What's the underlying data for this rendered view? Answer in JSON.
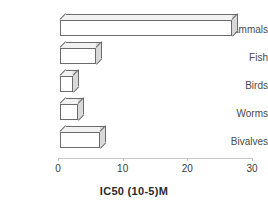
{
  "chart_data": {
    "type": "bar",
    "orientation": "horizontal",
    "style": "3d-bars",
    "title": "",
    "subtitle": "",
    "xlabel": "IC50 (10-5)M",
    "ylabel": "",
    "categories": [
      "Mammals",
      "Fish",
      "Birds",
      "Worms",
      "Bivalves"
    ],
    "values": [
      26.6,
      5.6,
      2.0,
      2.8,
      6.2
    ],
    "series": [
      {
        "name": "IC50",
        "values": [
          26.6,
          5.6,
          2.0,
          2.8,
          6.2
        ]
      }
    ],
    "xlim": [
      0,
      30
    ],
    "xticks": [
      0,
      10,
      20,
      30
    ],
    "xtick_labels": [
      "0",
      "10",
      "20",
      "30"
    ],
    "grid": false,
    "legend": false,
    "legend_position": "none",
    "annotations": [],
    "colors": {
      "bar_face": "#ffffff",
      "bar_top": "#f2f2f2",
      "bar_side": "#d9d9d9",
      "bar_outline": "#6b6b6b",
      "axis": "#c8c8c8",
      "label_text": "#4a4a4a",
      "tick_text": "#3a3a3a",
      "title_text": "#2b2b2b",
      "background": "#ffffff"
    }
  },
  "axis": {
    "x_title": "IC50 (10-5)M",
    "ticks": [
      {
        "label": "0",
        "value": 0
      },
      {
        "label": "10",
        "value": 10
      },
      {
        "label": "20",
        "value": 20
      },
      {
        "label": "30",
        "value": 30
      }
    ]
  },
  "bars": [
    {
      "label": "Mammals",
      "value": 26.6
    },
    {
      "label": "Fish",
      "value": 5.6
    },
    {
      "label": "Birds",
      "value": 2.0
    },
    {
      "label": "Worms",
      "value": 2.8
    },
    {
      "label": "Bivalves",
      "value": 6.2
    }
  ]
}
